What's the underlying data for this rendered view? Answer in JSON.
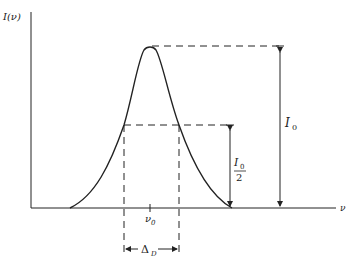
{
  "diagram": {
    "y_axis_label": "I(ν)",
    "x_axis_label": "ν",
    "center_label": "ν",
    "center_sub": "0",
    "peak_label": "I",
    "peak_sub": "0",
    "half_num": "I",
    "half_num_sub": "0",
    "half_den": "2",
    "width_label": "Δ",
    "width_sub": "D",
    "colors": {
      "line": "#222222",
      "background": "#ffffff"
    }
  }
}
